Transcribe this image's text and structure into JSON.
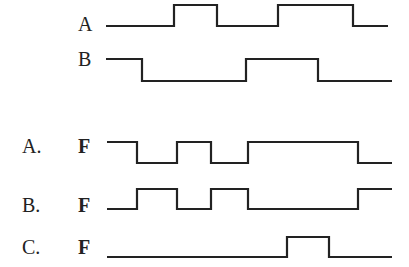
{
  "inputs": {
    "A": {
      "label": "A",
      "x_start": 106,
      "x_end": 388,
      "y_low": 26,
      "y_high": 5,
      "edges": [
        174,
        217,
        278,
        353
      ],
      "initial": 0
    },
    "B": {
      "label": "B",
      "x_start": 106,
      "x_end": 392,
      "y_low": 81,
      "y_high": 59,
      "edges": [
        142,
        246,
        318
      ],
      "initial": 1
    }
  },
  "options": [
    {
      "label": "A.",
      "signal": "F",
      "x_start": 107,
      "x_end": 392,
      "y_low": 163,
      "y_high": 142,
      "edges": [
        137,
        177,
        211,
        248,
        358
      ],
      "initial": 1
    },
    {
      "label": "B.",
      "signal": "F",
      "x_start": 107,
      "x_end": 392,
      "y_low": 209,
      "y_high": 189,
      "edges": [
        137,
        177,
        211,
        248,
        358
      ],
      "initial": 0
    },
    {
      "label": "C.",
      "signal": "F",
      "x_start": 107,
      "x_end": 392,
      "y_low": 257,
      "y_high": 237,
      "edges": [
        287,
        329
      ],
      "initial": 0
    }
  ],
  "colors": {
    "line": "#222222",
    "background": "#ffffff"
  }
}
